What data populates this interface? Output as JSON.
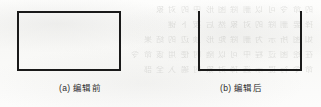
{
  "figure": {
    "background_color": "#fbfbfa",
    "stroke_color": "#1a1a1a",
    "panels": [
      {
        "id": "panel-a",
        "shape": "closed-rectangle",
        "shape_name": "rectangle-closed",
        "caption_label": "(a)",
        "caption_text": "编辑前",
        "caption_full": "(a) 编辑前",
        "edges_drawn": [
          "top",
          "right",
          "bottom",
          "left"
        ],
        "stroke_width_px": 2,
        "width_px": 104,
        "height_px": 60
      },
      {
        "id": "panel-b",
        "shape": "open-rectangle",
        "shape_name": "rectangle-top-edge-removed",
        "caption_label": "(b)",
        "caption_text": "编辑后",
        "caption_full": "(b) 编辑后",
        "edges_drawn": [
          "right",
          "bottom",
          "left"
        ],
        "stroke_width_px": 2,
        "width_px": 104,
        "height_px": 60
      }
    ]
  },
  "bleed_through": {
    "note": "faint mirrored text showing through scanned paper",
    "lines": [
      "的 命 令 可 以 删 除 图 形 中 的 对 象",
      "择 要 删 除 的 对 象 然 后 按 下 键",
      "如 图 所 示 为 删 除 矩 形 顶 边 的 结 果",
      "在 绘 图 过 程 中 可 以 随 时 使 用 该 命 令",
      "命 令 行 提 示 选 择 对 象 时 输 入 全 部"
    ]
  }
}
